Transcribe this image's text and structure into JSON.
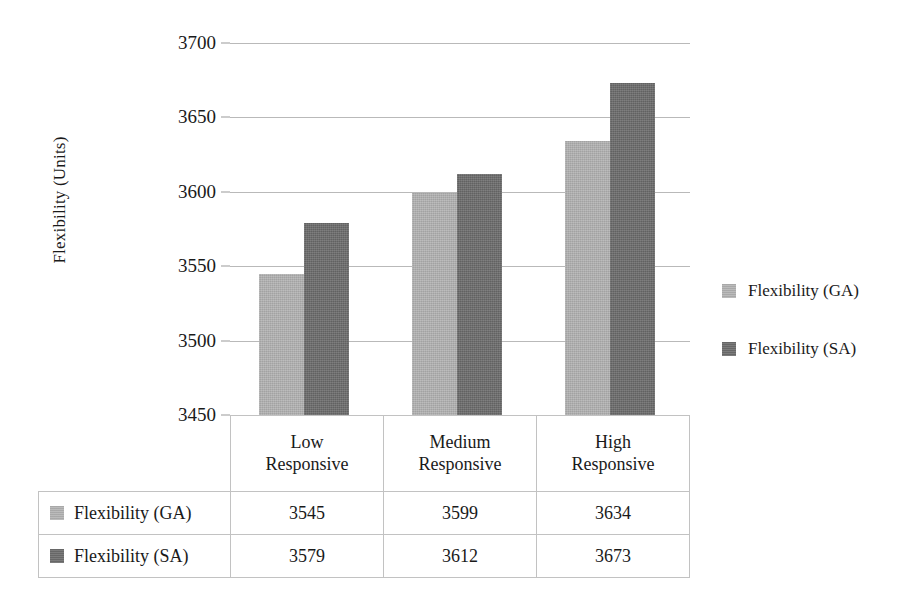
{
  "chart_data": {
    "type": "bar",
    "title": "",
    "xlabel": "",
    "ylabel": "Flexibility (Units)",
    "categories": [
      "Low Responsive",
      "Medium Responsive",
      "High Responsive"
    ],
    "category_lines": [
      [
        "Low",
        "Responsive"
      ],
      [
        "Medium",
        "Responsive"
      ],
      [
        "High",
        "Responsive"
      ]
    ],
    "series": [
      {
        "name": "Flexibility (GA)",
        "values": [
          3545,
          3599,
          3634
        ],
        "color": "#b3b3b3"
      },
      {
        "name": "Flexibility (SA)",
        "values": [
          3579,
          3612,
          3673
        ],
        "color": "#6d6d6d"
      }
    ],
    "ylim": [
      3450,
      3700
    ],
    "ytick_step": 50,
    "ytick_labels": [
      "3700",
      "3650",
      "3600",
      "3550",
      "3500",
      "3450"
    ],
    "ytick_values": [
      3700,
      3650,
      3600,
      3550,
      3500,
      3450
    ],
    "grid": true,
    "legend_position": "right",
    "has_data_table": true
  },
  "legend": {
    "entries": [
      {
        "label": "Flexibility (GA)",
        "swatch": "ga"
      },
      {
        "label": "Flexibility (SA)",
        "swatch": "sa"
      }
    ]
  },
  "table": {
    "corner": "",
    "column_headers": [
      "Low Responsive",
      "Medium Responsive",
      "High Responsive"
    ],
    "rows": [
      {
        "series": "Flexibility (GA)",
        "swatch": "ga",
        "values": [
          "3545",
          "3599",
          "3634"
        ]
      },
      {
        "series": "Flexibility (SA)",
        "swatch": "sa",
        "values": [
          "3579",
          "3612",
          "3673"
        ]
      }
    ]
  },
  "colors": {
    "series_ga": "#b3b3b3",
    "series_sa": "#6d6d6d",
    "gridline": "#b9b9b9",
    "table_border": "#c2c2c2",
    "text": "#1a1a1a",
    "background": "#ffffff"
  }
}
